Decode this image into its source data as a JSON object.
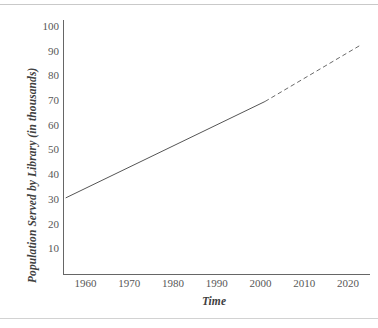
{
  "figure": {
    "kind": "line-chart",
    "background_color": "#ffffff",
    "line_color": "#555555",
    "axis_color": "#666666",
    "text_color": "#4f4f4f"
  },
  "decorations": {
    "top_rule": "",
    "bottom_rule": ""
  },
  "chart_data": {
    "type": "line",
    "title": "",
    "xlabel": "Time",
    "ylabel": "Population Served by Library (in thousands)",
    "xlim": [
      1955,
      2025
    ],
    "ylim": [
      0,
      103
    ],
    "grid": false,
    "legend": false,
    "xticks": [
      1960,
      1970,
      1980,
      1990,
      2000,
      2010,
      2020
    ],
    "xticklabels": [
      "1960",
      "1970",
      "1980",
      "1990",
      "2000",
      "2010",
      "2020"
    ],
    "yticks": [
      10,
      20,
      30,
      40,
      50,
      60,
      70,
      80,
      90,
      100
    ],
    "yticklabels": [
      "10",
      "20",
      "30",
      "40",
      "50",
      "60",
      "70",
      "80",
      "90",
      "100"
    ],
    "series": [
      {
        "name": "Observed trend",
        "style": "solid",
        "color": "#555555",
        "x": [
          1955.5,
          2001
        ],
        "y": [
          31,
          70
        ]
      },
      {
        "name": "Projected trend",
        "style": "dashed",
        "color": "#6a6a6a",
        "x": [
          2001,
          2023
        ],
        "y": [
          70,
          93
        ]
      }
    ],
    "annotations": []
  }
}
